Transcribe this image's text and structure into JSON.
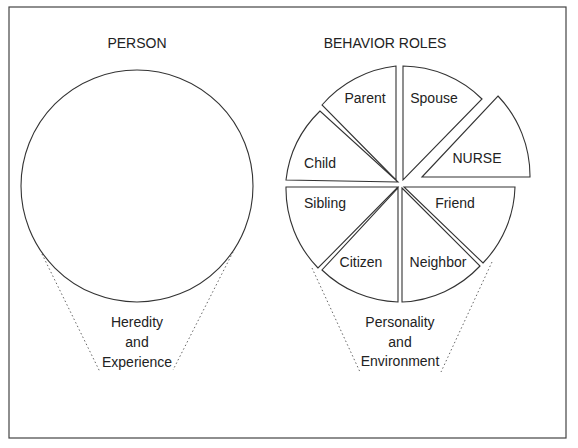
{
  "left_panel": {
    "title": "PERSON",
    "caption": [
      "Heredity",
      "and",
      "Experience"
    ]
  },
  "right_panel": {
    "title": "BEHAVIOR ROLES",
    "segments": {
      "parent": "Parent",
      "spouse": "Spouse",
      "nurse": "NURSE",
      "child": "Child",
      "sibling": "Sibling",
      "friend": "Friend",
      "citizen": "Citizen",
      "neighbor": "Neighbor"
    },
    "caption": [
      "Personality",
      "and",
      "Environment"
    ]
  },
  "colors": {
    "line": "#333333",
    "background": "#ffffff"
  }
}
